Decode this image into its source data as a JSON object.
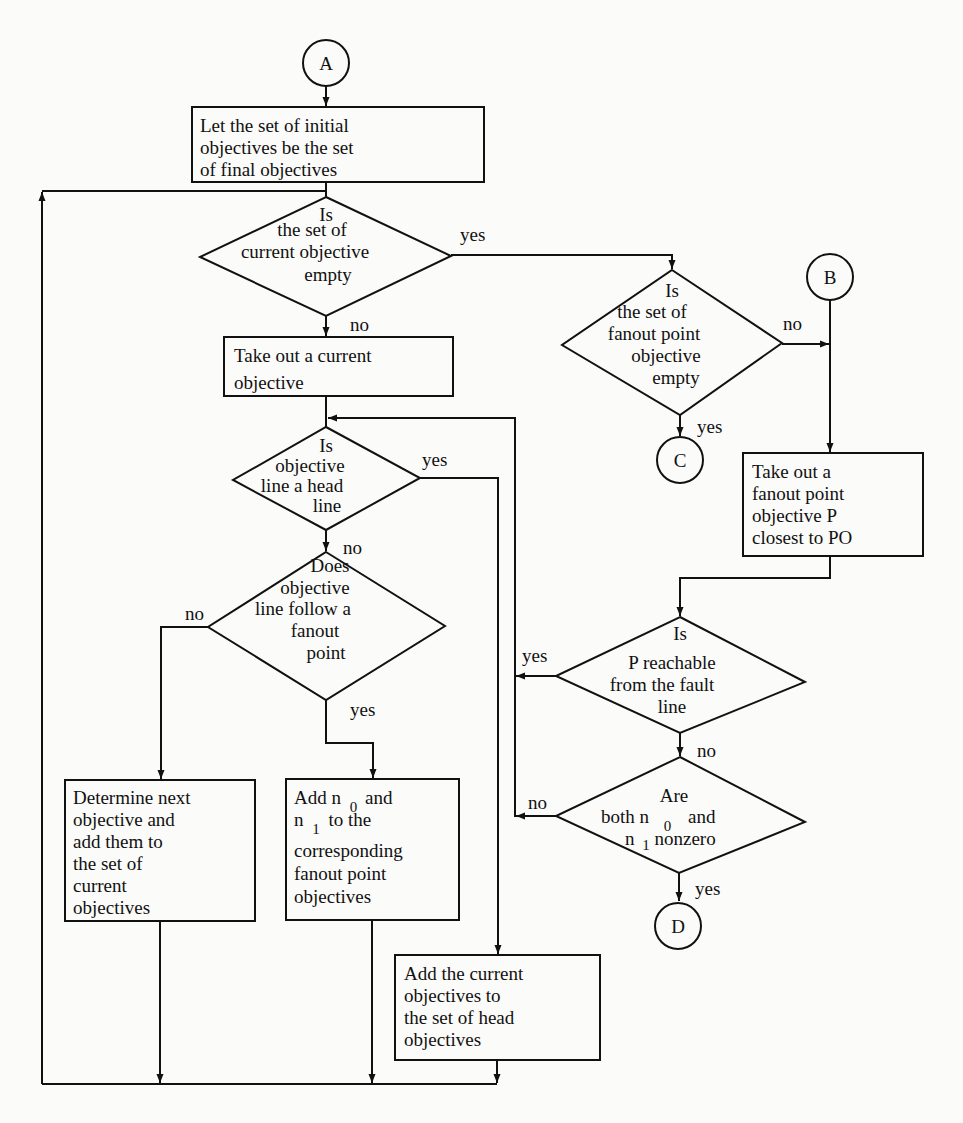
{
  "connectors": {
    "A": "A",
    "B": "B",
    "C": "C",
    "D": "D"
  },
  "nodes": {
    "init_box": [
      "Let the set of initial",
      "objectives be the set",
      "of final objectives"
    ],
    "current_empty": [
      "Is",
      "the set of",
      "current objective",
      "empty"
    ],
    "take_current": [
      "Take out a current",
      "objective"
    ],
    "head_line": [
      "Is",
      "objective",
      "line a head",
      "line"
    ],
    "follow_fanout": [
      "Does",
      "objective",
      "line follow a",
      "fanout",
      "point"
    ],
    "determine_next": [
      "Determine next",
      "objective and",
      "add them to",
      "the set of",
      "current",
      "objectives"
    ],
    "add_n": {
      "line1_a": "Add n",
      "line1_sub": "0",
      "line1_b": "and",
      "line2_a": "n",
      "line2_sub": "1",
      "line2_b": "to the",
      "rest": [
        "corresponding",
        "fanout point",
        "objectives"
      ]
    },
    "add_head": [
      "Add the current",
      "objectives to",
      "the set of head",
      "objectives"
    ],
    "fanout_empty": [
      "Is",
      "the set of",
      "fanout point",
      "objective",
      "empty"
    ],
    "take_fanout": [
      "Take out a",
      "fanout point",
      "objective P",
      "closest to PO"
    ],
    "reachable": [
      "Is",
      "P reachable",
      "from the fault",
      "line"
    ],
    "nonzero": {
      "line1": "Are",
      "line2_a": "both n",
      "line2_sub": "0",
      "line2_b": "and",
      "line3_a": "n",
      "line3_sub": "1",
      "line3_b": "nonzero"
    }
  },
  "edge_labels": {
    "current_empty_yes": "yes",
    "current_empty_no": "no",
    "head_line_yes": "yes",
    "head_line_no": "no",
    "follow_fanout_no": "no",
    "follow_fanout_yes": "yes",
    "fanout_empty_no": "no",
    "fanout_empty_yes": "yes",
    "reachable_yes": "yes",
    "reachable_no": "no",
    "nonzero_no": "no",
    "nonzero_yes": "yes"
  }
}
